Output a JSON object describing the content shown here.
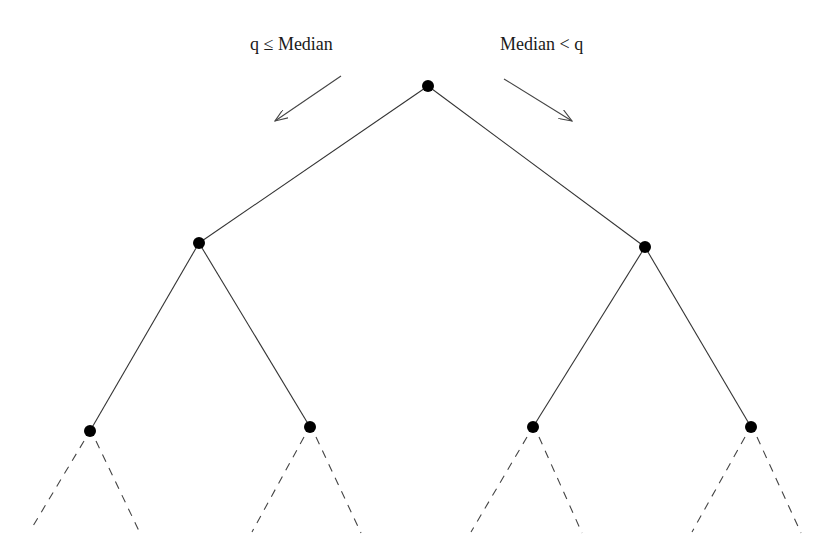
{
  "diagram": {
    "type": "binary-tree",
    "labels": {
      "left": "q ≤ Median",
      "right": "Median < q"
    },
    "colors": {
      "node": "#000000",
      "edge": "#333333",
      "background": "#ffffff"
    },
    "nodes": [
      {
        "id": "root",
        "x": 428,
        "y": 86
      },
      {
        "id": "l",
        "x": 199,
        "y": 243
      },
      {
        "id": "r",
        "x": 645,
        "y": 247
      },
      {
        "id": "ll",
        "x": 90,
        "y": 431
      },
      {
        "id": "lr",
        "x": 310,
        "y": 427
      },
      {
        "id": "rl",
        "x": 533,
        "y": 427
      },
      {
        "id": "rr",
        "x": 751,
        "y": 427
      }
    ],
    "edges_solid": [
      [
        "root",
        "l"
      ],
      [
        "root",
        "r"
      ],
      [
        "l",
        "ll"
      ],
      [
        "l",
        "lr"
      ],
      [
        "r",
        "rl"
      ],
      [
        "r",
        "rr"
      ]
    ],
    "edges_dashed_count": 8,
    "arrows": [
      {
        "direction": "left",
        "from": [
          341,
          76
        ],
        "to": [
          275,
          121
        ]
      },
      {
        "direction": "right",
        "from": [
          504,
          79
        ],
        "to": [
          572,
          121
        ]
      }
    ]
  }
}
